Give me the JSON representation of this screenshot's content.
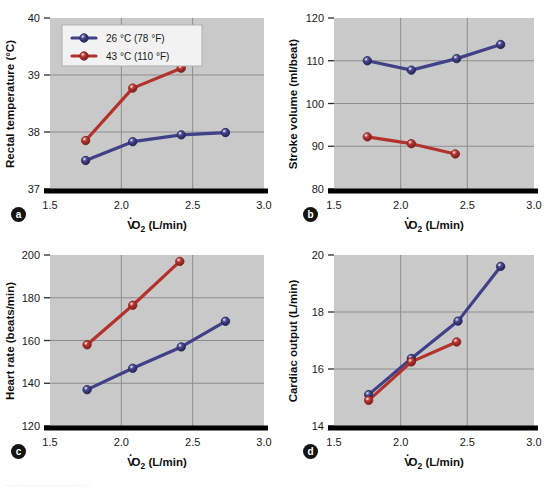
{
  "figure": {
    "background": "#ffffff",
    "plot_background": "#c9c9c9",
    "grid_color": "#8d8d8d",
    "axis_color": "#000000",
    "caption": "............ ... ......... ..... ... .......... ...."
  },
  "colors": {
    "cool_series": "#414189",
    "hot_series": "#b3322d",
    "cool_series_light": "#7070b5",
    "hot_series_light": "#d96a63"
  },
  "legend": {
    "position": "upper-left-panel-a",
    "entries": [
      {
        "label": "26 °C (78 °F)",
        "color_key": "cool_series"
      },
      {
        "label": "43 °C (110 °F)",
        "color_key": "hot_series"
      }
    ]
  },
  "shared": {
    "xlabel_prefix": "V",
    "xlabel_sub": "2",
    "xlabel_suffix": "O",
    "xlabel_units": " (L/min)",
    "xlabel_full": "V̇O2 (L/min)",
    "xticks": [
      "1.5",
      "2.0",
      "2.5",
      "3.0"
    ],
    "xlim": [
      1.5,
      3.0
    ]
  },
  "panels": [
    {
      "id": "a",
      "badge": "a",
      "ylabel": "Rectal temperature (°C)",
      "yticks": [
        "37",
        "38",
        "39",
        "40"
      ],
      "ylim": [
        37,
        40
      ]
    },
    {
      "id": "b",
      "badge": "b",
      "ylabel": "Stroke volume (ml/beat)",
      "yticks": [
        "80",
        "90",
        "100",
        "110",
        "120"
      ],
      "ylim": [
        80,
        120
      ]
    },
    {
      "id": "c",
      "badge": "c",
      "ylabel": "Heart rate (beats/min)",
      "yticks": [
        "120",
        "140",
        "160",
        "180",
        "200"
      ],
      "ylim": [
        120,
        200
      ]
    },
    {
      "id": "d",
      "badge": "d",
      "ylabel": "Cardiac output (L/min)",
      "yticks": [
        "14",
        "16",
        "18",
        "20"
      ],
      "ylim": [
        14,
        20
      ]
    }
  ],
  "chart_data": [
    {
      "panel": "a",
      "type": "line",
      "title": "",
      "xlabel": "V̇O2 (L/min)",
      "ylabel": "Rectal temperature (°C)",
      "xlim": [
        1.5,
        3.0
      ],
      "ylim": [
        37,
        40
      ],
      "xticks": [
        1.5,
        2.0,
        2.5,
        3.0
      ],
      "yticks": [
        37,
        38,
        39,
        40
      ],
      "grid": true,
      "legend": "upper left",
      "series": [
        {
          "name": "26 °C (78 °F)",
          "color": "#414189",
          "x": [
            1.75,
            2.08,
            2.42,
            2.73
          ],
          "y": [
            37.5,
            37.83,
            37.95,
            37.99
          ]
        },
        {
          "name": "43 °C (110 °F)",
          "color": "#b3322d",
          "x": [
            1.75,
            2.08,
            2.42
          ],
          "y": [
            37.85,
            38.77,
            39.12
          ]
        }
      ]
    },
    {
      "panel": "b",
      "type": "line",
      "title": "",
      "xlabel": "V̇O2 (L/min)",
      "ylabel": "Stroke volume (ml/beat)",
      "xlim": [
        1.5,
        3.0
      ],
      "ylim": [
        80,
        120
      ],
      "xticks": [
        1.5,
        2.0,
        2.5,
        3.0
      ],
      "yticks": [
        80,
        90,
        100,
        110,
        120
      ],
      "grid": true,
      "legend": "none",
      "series": [
        {
          "name": "26 °C (78 °F)",
          "color": "#414189",
          "x": [
            1.75,
            2.08,
            2.42,
            2.75
          ],
          "y": [
            110.0,
            107.8,
            110.5,
            113.8
          ]
        },
        {
          "name": "43 °C (110 °F)",
          "color": "#b3322d",
          "x": [
            1.75,
            2.08,
            2.41
          ],
          "y": [
            92.2,
            90.6,
            88.2
          ]
        }
      ]
    },
    {
      "panel": "c",
      "type": "line",
      "title": "",
      "xlabel": "V̇O2 (L/min)",
      "ylabel": "Heart rate (beats/min)",
      "xlim": [
        1.5,
        3.0
      ],
      "ylim": [
        120,
        200
      ],
      "xticks": [
        1.5,
        2.0,
        2.5,
        3.0
      ],
      "yticks": [
        120,
        140,
        160,
        180,
        200
      ],
      "grid": true,
      "legend": "none",
      "series": [
        {
          "name": "26 °C (78 °F)",
          "color": "#414189",
          "x": [
            1.76,
            2.08,
            2.42,
            2.73
          ],
          "y": [
            137.0,
            147.0,
            157.0,
            169.0
          ]
        },
        {
          "name": "43 °C (110 °F)",
          "color": "#b3322d",
          "x": [
            1.76,
            2.08,
            2.41
          ],
          "y": [
            158.0,
            176.5,
            197.0
          ]
        }
      ]
    },
    {
      "panel": "d",
      "type": "line",
      "title": "",
      "xlabel": "V̇O2 (L/min)",
      "ylabel": "Cardiac output (L/min)",
      "xlim": [
        1.5,
        3.0
      ],
      "ylim": [
        14,
        20
      ],
      "xticks": [
        1.5,
        2.0,
        2.5,
        3.0
      ],
      "yticks": [
        14,
        16,
        18,
        20
      ],
      "grid": true,
      "legend": "none",
      "series": [
        {
          "name": "26 °C (78 °F)",
          "color": "#414189",
          "x": [
            1.76,
            2.08,
            2.43,
            2.75
          ],
          "y": [
            15.1,
            16.37,
            17.68,
            19.6
          ]
        },
        {
          "name": "43 °C (110 °F)",
          "color": "#b3322d",
          "x": [
            1.76,
            2.08,
            2.42
          ],
          "y": [
            14.9,
            16.25,
            16.95
          ]
        }
      ]
    }
  ]
}
